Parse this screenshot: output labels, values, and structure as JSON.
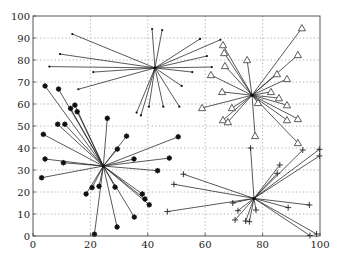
{
  "chart_data": {
    "type": "scatter",
    "title": "",
    "xlabel": "",
    "ylabel": "",
    "xlim": [
      0,
      100
    ],
    "ylim": [
      0,
      100
    ],
    "xticks": [
      0,
      20,
      40,
      60,
      80,
      100
    ],
    "yticks": [
      0,
      10,
      20,
      30,
      40,
      50,
      60,
      70,
      80,
      90,
      100
    ],
    "xtick_labels": [
      "0",
      "20",
      "40",
      "60",
      "80",
      "100"
    ],
    "ytick_labels": [
      "0",
      "10",
      "20",
      "30",
      "40",
      "50",
      "60",
      "70",
      "80",
      "90",
      "100"
    ],
    "grid": true,
    "legend": null,
    "series": [
      {
        "name": "cluster-1",
        "marker": "dot",
        "center": [
          42.5,
          76.4
        ],
        "points": [
          [
            13.7,
            91.8
          ],
          [
            9.4,
            82.7
          ],
          [
            5.7,
            77.0
          ],
          [
            21.0,
            74.5
          ],
          [
            15.8,
            66.7
          ],
          [
            41.5,
            94.1
          ],
          [
            45.0,
            93.6
          ],
          [
            58.2,
            89.6
          ],
          [
            65.3,
            89.2
          ],
          [
            60.6,
            81.8
          ],
          [
            62.3,
            76.8
          ],
          [
            55.5,
            74.5
          ],
          [
            51.8,
            68.2
          ],
          [
            51.0,
            58.8
          ],
          [
            45.4,
            58.8
          ],
          [
            40.4,
            58.8
          ],
          [
            36.1,
            56.1
          ],
          [
            37.6,
            54.8
          ]
        ]
      },
      {
        "name": "cluster-2",
        "marker": "triangle",
        "center": [
          76.3,
          64.0
        ],
        "points": [
          [
            93.7,
            94.5
          ],
          [
            92.3,
            82.3
          ],
          [
            66.2,
            86.8
          ],
          [
            66.6,
            83.2
          ],
          [
            66.9,
            77.3
          ],
          [
            74.6,
            80.0
          ],
          [
            62.0,
            73.2
          ],
          [
            85.0,
            73.6
          ],
          [
            88.5,
            71.4
          ],
          [
            65.9,
            65.5
          ],
          [
            82.9,
            65.5
          ],
          [
            85.7,
            62.7
          ],
          [
            88.5,
            59.5
          ],
          [
            58.9,
            58.2
          ],
          [
            69.3,
            58.2
          ],
          [
            78.4,
            60.5
          ],
          [
            66.2,
            52.7
          ],
          [
            67.9,
            51.8
          ],
          [
            88.5,
            52.7
          ],
          [
            92.3,
            53.2
          ],
          [
            77.4,
            45.5
          ],
          [
            92.3,
            42.3
          ]
        ]
      },
      {
        "name": "cluster-3",
        "marker": "star",
        "center": [
          24.5,
          31.8
        ],
        "points": [
          [
            4.2,
            68.2
          ],
          [
            8.9,
            66.8
          ],
          [
            13.1,
            58.0
          ],
          [
            14.6,
            59.5
          ],
          [
            15.4,
            56.5
          ],
          [
            25.9,
            53.5
          ],
          [
            8.6,
            50.8
          ],
          [
            11.1,
            50.8
          ],
          [
            3.6,
            46.2
          ],
          [
            32.6,
            45.4
          ],
          [
            29.4,
            39.5
          ],
          [
            50.6,
            45.1
          ],
          [
            4.2,
            35.0
          ],
          [
            10.6,
            33.3
          ],
          [
            35.2,
            35.0
          ],
          [
            47.5,
            35.4
          ],
          [
            43.4,
            29.7
          ],
          [
            3.0,
            26.5
          ],
          [
            20.6,
            22.0
          ],
          [
            23.0,
            22.6
          ],
          [
            28.6,
            22.2
          ],
          [
            18.5,
            19.1
          ],
          [
            38.1,
            19.1
          ],
          [
            39.0,
            16.8
          ],
          [
            40.5,
            14.2
          ],
          [
            35.3,
            8.6
          ],
          [
            29.3,
            4.1
          ],
          [
            21.4,
            0.8
          ]
        ]
      },
      {
        "name": "cluster-4",
        "marker": "plus",
        "center": [
          77.0,
          17.1
        ],
        "points": [
          [
            75.8,
            40.0
          ],
          [
            94.0,
            39.1
          ],
          [
            99.8,
            39.4
          ],
          [
            99.8,
            36.4
          ],
          [
            86.0,
            32.3
          ],
          [
            85.1,
            28.5
          ],
          [
            52.4,
            28.1
          ],
          [
            49.1,
            23.5
          ],
          [
            96.3,
            14.1
          ],
          [
            88.9,
            12.9
          ],
          [
            69.6,
            15.0
          ],
          [
            46.8,
            11.1
          ],
          [
            71.4,
            11.5
          ],
          [
            77.7,
            11.8
          ],
          [
            70.4,
            7.3
          ],
          [
            74.1,
            6.8
          ],
          [
            75.4,
            6.5
          ],
          [
            98.8,
            0.9
          ],
          [
            96.5,
            0.2
          ]
        ]
      }
    ]
  },
  "layout": {
    "plot_left": 33,
    "plot_right": 320,
    "plot_top": 16,
    "plot_bottom": 236
  }
}
